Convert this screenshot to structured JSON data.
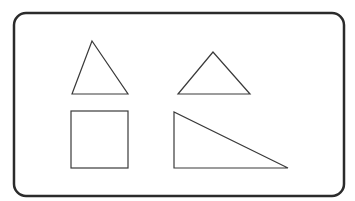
{
  "figure": {
    "background": "#ffffff",
    "frame": {
      "x": 14,
      "y": 13,
      "width": 330,
      "height": 183,
      "radius": 12,
      "stroke": "#2b2b2b",
      "stroke_width": 2.5
    },
    "shape_stroke": "#3a3a3a",
    "shapes": [
      {
        "name": "acute-triangle",
        "type": "triangle",
        "points": "92,41 72,94 128,94"
      },
      {
        "name": "obtuse-triangle",
        "type": "triangle",
        "points": "213,52 178,94 250,94"
      },
      {
        "name": "square",
        "type": "rect",
        "x": 71,
        "y": 111,
        "width": 57,
        "height": 57
      },
      {
        "name": "right-triangle",
        "type": "triangle",
        "points": "174,112 174,168 288,168"
      }
    ]
  }
}
